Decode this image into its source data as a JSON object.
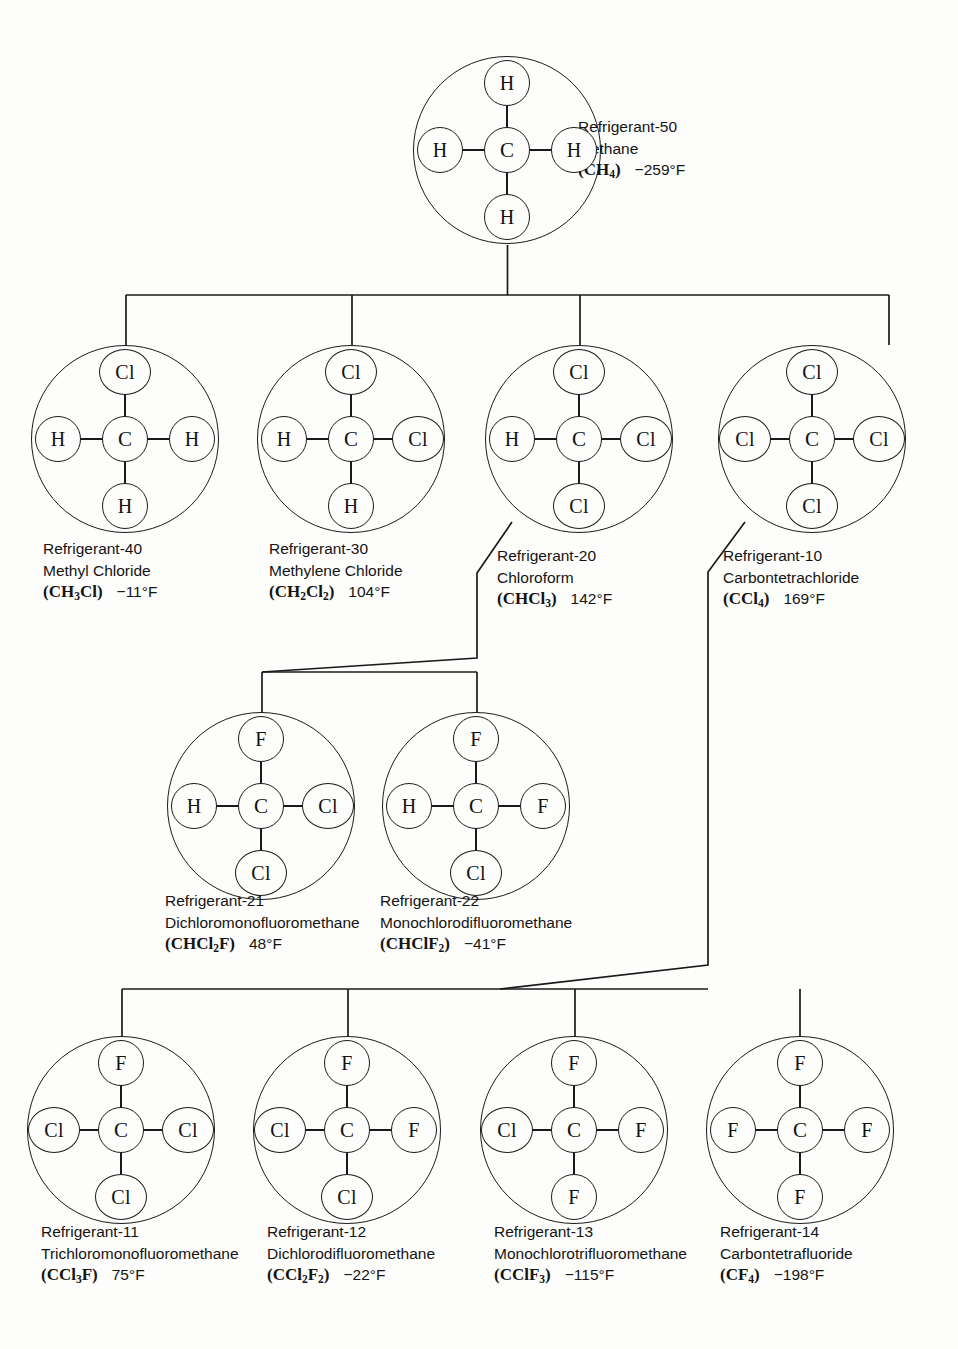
{
  "diagram": {
    "type": "tree",
    "orientation": "top-down"
  },
  "molecules": [
    {
      "id": "r50",
      "number": "Refrigerant-50",
      "name": "Methane",
      "formula_html": "(CH<sub>4</sub>)",
      "formula_text": "(CH4)",
      "temperature": "−259°F",
      "atoms": {
        "center": "C",
        "up": "H",
        "down": "H",
        "left": "H",
        "right": "H"
      },
      "row": 1
    },
    {
      "id": "r40",
      "number": "Refrigerant-40",
      "name": "Methyl Chloride",
      "formula_html": "(CH<sub>3</sub>Cl)",
      "formula_text": "(CH3Cl)",
      "temperature": "−11°F",
      "atoms": {
        "center": "C",
        "up": "Cl",
        "down": "H",
        "left": "H",
        "right": "H"
      },
      "row": 2
    },
    {
      "id": "r30",
      "number": "Refrigerant-30",
      "name": "Methylene Chloride",
      "formula_html": "(CH<sub>2</sub>Cl<sub>2</sub>)",
      "formula_text": "(CH2Cl2)",
      "temperature": "104°F",
      "atoms": {
        "center": "C",
        "up": "Cl",
        "down": "H",
        "left": "H",
        "right": "Cl"
      },
      "row": 2
    },
    {
      "id": "r20",
      "number": "Refrigerant-20",
      "name": "Chloroform",
      "formula_html": "(CHCl<sub>3</sub>)",
      "formula_text": "(CHCl3)",
      "temperature": "142°F",
      "atoms": {
        "center": "C",
        "up": "Cl",
        "down": "Cl",
        "left": "H",
        "right": "Cl"
      },
      "row": 2
    },
    {
      "id": "r10",
      "number": "Refrigerant-10",
      "name": "Carbontetrachloride",
      "formula_html": "(CCl<sub>4</sub>)",
      "formula_text": "(CCl4)",
      "temperature": "169°F",
      "atoms": {
        "center": "C",
        "up": "Cl",
        "down": "Cl",
        "left": "Cl",
        "right": "Cl"
      },
      "row": 2
    },
    {
      "id": "r21",
      "number": "Refrigerant-21",
      "name": "Dichloromonofluoromethane",
      "formula_html": "(CHCl<sub>2</sub>F)",
      "formula_text": "(CHCl2F)",
      "temperature": "48°F",
      "atoms": {
        "center": "C",
        "up": "F",
        "down": "Cl",
        "left": "H",
        "right": "Cl"
      },
      "row": 3
    },
    {
      "id": "r22",
      "number": "Refrigerant-22",
      "name": "Monochlorodifluoromethane",
      "formula_html": "(CHClF<sub>2</sub>)",
      "formula_text": "(CHClF2)",
      "temperature": "−41°F",
      "atoms": {
        "center": "C",
        "up": "F",
        "down": "Cl",
        "left": "H",
        "right": "F"
      },
      "row": 3
    },
    {
      "id": "r11",
      "number": "Refrigerant-11",
      "name": "Trichloromonofluoromethane",
      "formula_html": "(CCl<sub>3</sub>F)",
      "formula_text": "(CCl3F)",
      "temperature": "75°F",
      "atoms": {
        "center": "C",
        "up": "F",
        "down": "Cl",
        "left": "Cl",
        "right": "Cl"
      },
      "row": 4
    },
    {
      "id": "r12",
      "number": "Refrigerant-12",
      "name": "Dichlorodifluoromethane",
      "formula_html": "(CCl<sub>2</sub>F<sub>2</sub>)",
      "formula_text": "(CCl2F2)",
      "temperature": "−22°F",
      "atoms": {
        "center": "C",
        "up": "F",
        "down": "Cl",
        "left": "Cl",
        "right": "F"
      },
      "row": 4
    },
    {
      "id": "r13",
      "number": "Refrigerant-13",
      "name": "Monochlorotrifluoromethane",
      "formula_html": "(CClF<sub>3</sub>)",
      "formula_text": "(CClF3)",
      "temperature": "−115°F",
      "atoms": {
        "center": "C",
        "up": "F",
        "down": "F",
        "left": "Cl",
        "right": "F"
      },
      "row": 4
    },
    {
      "id": "r14",
      "number": "Refrigerant-14",
      "name": "Carbontetrafluoride",
      "formula_html": "(CF<sub>4</sub>)",
      "formula_text": "(CF4)",
      "temperature": "−198°F",
      "atoms": {
        "center": "C",
        "up": "F",
        "down": "F",
        "left": "F",
        "right": "F"
      },
      "row": 4
    }
  ],
  "colors": {
    "line": "#1a1a1a",
    "background": "#fdfdfb",
    "text": "#141414"
  }
}
